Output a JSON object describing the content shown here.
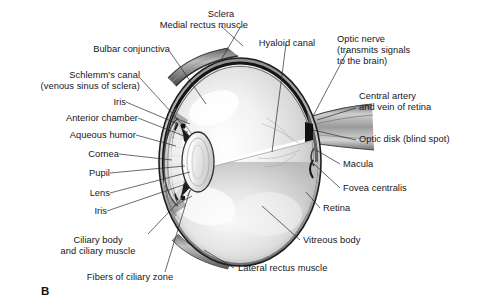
{
  "figure": {
    "panel_label": "B",
    "style": "grayscale anatomical illustration",
    "background_color": "#ffffff",
    "text_color": "#16161a",
    "leader_line_color": "#2a2a2a"
  },
  "labels": {
    "medial_rectus_muscle": "Medial rectus muscle",
    "sclera": "Sclera",
    "hyaloid_canal": "Hyaloid canal",
    "optic_nerve_line1": "Optic nerve",
    "optic_nerve_line2": "(transmits signals",
    "optic_nerve_line3": "to the brain)",
    "bulbar_conjunctiva": "Bulbar conjunctiva",
    "schlemms_canal_line1": "Schlemm's canal",
    "schlemms_canal_line2": "(venous sinus of sclera)",
    "iris_upper": "Iris",
    "anterior_chamber": "Anterior chamber",
    "aqueous_humor": "Aqueous humor",
    "cornea": "Cornea",
    "pupil": "Pupil",
    "lens": "Lens",
    "iris_lower": "Iris",
    "ciliary_body_line1": "Ciliary body",
    "ciliary_body_line2": "and ciliary muscle",
    "fibers_of_ciliary_zone": "Fibers of ciliary zone",
    "central_artery_line1": "Central artery",
    "central_artery_line2": "and vein of retina",
    "optic_disk": "Optic disk (blind spot)",
    "macula": "Macula",
    "fovea_centralis": "Fovea centralis",
    "retina": "Retina",
    "vitreous_body": "Vitreous body",
    "lateral_rectus_muscle": "Lateral rectus muscle"
  }
}
